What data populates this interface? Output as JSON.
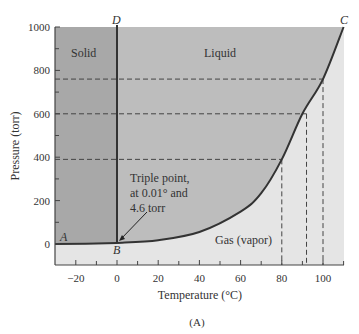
{
  "chart_data": {
    "type": "line",
    "title": "",
    "subtitle": "(A)",
    "xlabel": "Temperature (°C)",
    "ylabel": "Pressure (torr)",
    "xlim": [
      -30,
      110
    ],
    "ylim": [
      0,
      1000
    ],
    "x_ticks": [
      -20,
      0,
      20,
      40,
      60,
      80,
      100
    ],
    "x_tick_labels": [
      "−20",
      "0",
      "20",
      "40",
      "60",
      "80",
      "100"
    ],
    "y_ticks": [
      0,
      200,
      400,
      600,
      800,
      1000
    ],
    "y_tick_labels": [
      "0",
      "200",
      "400",
      "600",
      "800",
      "1000"
    ],
    "grid": false,
    "regions": [
      {
        "name": "Solid",
        "color": "#a8a8a8"
      },
      {
        "name": "Liquid",
        "color": "#bdbdbd"
      },
      {
        "name": "Gas (vapor)",
        "color": "#e5e5e5"
      }
    ],
    "series": [
      {
        "name": "Sublimation curve A–B",
        "x": [
          -30,
          0
        ],
        "y": [
          0,
          4.6
        ]
      },
      {
        "name": "Melting line B–D",
        "x": [
          0,
          0
        ],
        "y": [
          4.6,
          1000
        ]
      },
      {
        "name": "Vapor pressure curve B–C",
        "x": [
          0,
          20,
          40,
          60,
          70,
          80,
          90,
          100,
          110
        ],
        "y": [
          4.6,
          17.5,
          55,
          149,
          234,
          390,
          600,
          760,
          1000
        ]
      }
    ],
    "reference_lines": [
      {
        "type": "horizontal",
        "y": 760,
        "to_x": 100
      },
      {
        "type": "horizontal",
        "y": 600,
        "to_x": 92
      },
      {
        "type": "horizontal",
        "y": 390,
        "to_x": 80
      },
      {
        "type": "vertical",
        "x": 80,
        "to_y": 390
      },
      {
        "type": "vertical",
        "x": 92,
        "to_y": 600
      },
      {
        "type": "vertical",
        "x": 100,
        "to_y": 760
      }
    ],
    "point_labels": [
      "A",
      "B",
      "C",
      "D"
    ],
    "annotations": [
      "Triple point,",
      "at 0.01° and",
      "4.6 torr"
    ]
  }
}
